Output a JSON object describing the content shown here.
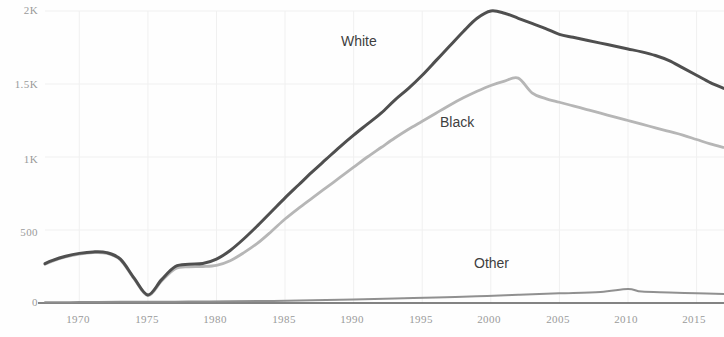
{
  "chart_data": {
    "type": "line",
    "title": "",
    "subtitle": "",
    "xlabel": "",
    "ylabel": "",
    "xlim": [
      1967.5,
      2017.0
    ],
    "ylim": [
      0,
      2000
    ],
    "grid": true,
    "legend_position": "inline-annotations",
    "x_ticks": [
      1970,
      1975,
      1980,
      1985,
      1990,
      1995,
      2000,
      2005,
      2010,
      2015
    ],
    "x_tick_labels": [
      "1970",
      "1975",
      "1980",
      "1985",
      "1990",
      "1995",
      "2000",
      "2005",
      "2010",
      "2015"
    ],
    "y_ticks": [
      0,
      500,
      1000,
      1500,
      2000
    ],
    "y_tick_labels": [
      "0",
      "500",
      "1K",
      "1.5K",
      "2K"
    ],
    "colors": {
      "white_series": "#4a4a4a",
      "black_series": "#b4b4b4",
      "other_series": "#8d8d8d",
      "axis_line": "#6e6e6e",
      "tick_text": "#9a9a9a",
      "annotation_text": "#3f3f3f",
      "background": "#fefefe",
      "gridline": "#f0f0f0"
    },
    "annotations": [
      {
        "text": "White",
        "x": 1991.0,
        "y": 1780
      },
      {
        "text": "Black",
        "x": 1998.2,
        "y": 1225
      },
      {
        "text": "Other",
        "x": 2000.7,
        "y": 260
      }
    ],
    "series": [
      {
        "name": "White",
        "color": "#4a4a4a",
        "x": [
          1967.5,
          1968,
          1969,
          1970,
          1971,
          1972,
          1973,
          1974,
          1975,
          1976,
          1977,
          1978,
          1979,
          1980,
          1981,
          1982,
          1983,
          1984,
          1985,
          1986,
          1987,
          1988,
          1989,
          1990,
          1991,
          1992,
          1993,
          1994,
          1995,
          1996,
          1997,
          1998,
          1999,
          2000,
          2001,
          2002,
          2003,
          2004,
          2005,
          2006,
          2007,
          2008,
          2009,
          2010,
          2011,
          2012,
          2013,
          2014,
          2015,
          2016,
          2017
        ],
        "y": [
          270,
          290,
          320,
          340,
          350,
          345,
          300,
          170,
          55,
          160,
          250,
          265,
          270,
          300,
          360,
          440,
          530,
          625,
          720,
          810,
          900,
          985,
          1070,
          1150,
          1225,
          1300,
          1390,
          1470,
          1560,
          1660,
          1760,
          1860,
          1950,
          2000,
          1985,
          1950,
          1915,
          1880,
          1840,
          1820,
          1800,
          1780,
          1760,
          1740,
          1720,
          1695,
          1660,
          1610,
          1560,
          1510,
          1470
        ]
      },
      {
        "name": "Black",
        "color": "#b4b4b4",
        "x": [
          1967.5,
          1968,
          1969,
          1970,
          1971,
          1972,
          1973,
          1974,
          1975,
          1976,
          1977,
          1978,
          1979,
          1980,
          1981,
          1982,
          1983,
          1984,
          1985,
          1986,
          1987,
          1988,
          1989,
          1990,
          1991,
          1992,
          1993,
          1994,
          1995,
          1996,
          1997,
          1998,
          1999,
          2000,
          2001,
          2002,
          2003,
          2004,
          2005,
          2006,
          2007,
          2008,
          2009,
          2010,
          2011,
          2012,
          2013,
          2014,
          2015,
          2016,
          2017
        ],
        "y": [
          265,
          285,
          315,
          335,
          345,
          340,
          295,
          165,
          50,
          150,
          235,
          248,
          250,
          258,
          290,
          345,
          410,
          490,
          575,
          650,
          720,
          790,
          860,
          930,
          1000,
          1065,
          1130,
          1190,
          1245,
          1300,
          1355,
          1405,
          1450,
          1490,
          1520,
          1540,
          1440,
          1400,
          1375,
          1350,
          1325,
          1300,
          1275,
          1250,
          1225,
          1200,
          1175,
          1150,
          1120,
          1090,
          1065
        ]
      },
      {
        "name": "Other",
        "color": "#8d8d8d",
        "x": [
          1967.5,
          1970,
          1973,
          1975,
          1978,
          1981,
          1984,
          1987,
          1990,
          1993,
          1996,
          1999,
          2002,
          2005,
          2008,
          2010,
          2011,
          2013,
          2015,
          2017
        ],
        "y": [
          5,
          6,
          8,
          8,
          10,
          12,
          14,
          18,
          24,
          30,
          38,
          46,
          56,
          66,
          76,
          96,
          78,
          72,
          66,
          62
        ]
      }
    ]
  }
}
